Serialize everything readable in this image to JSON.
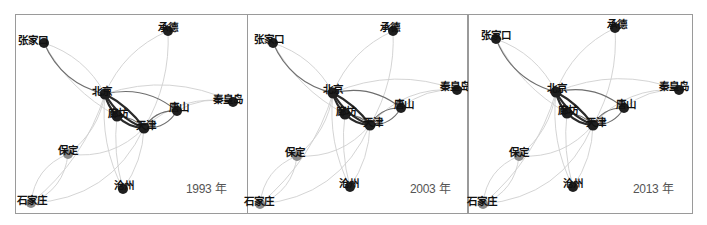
{
  "figure": {
    "type": "network-diagram",
    "colors": {
      "node_dark": "#1f1f1f",
      "node_grey": "#8a8a8a",
      "edge_strong": "#2a2a2a",
      "edge_medium": "#6e6e6e",
      "edge_weak": "#cfcfcf",
      "border": "#9a9a9a"
    }
  },
  "cities": [
    "张家口",
    "承德",
    "北京",
    "秦皇岛",
    "唐山",
    "廊坊",
    "天津",
    "保定",
    "沧州",
    "石家庄"
  ],
  "panels": [
    {
      "year_label": "1993 年",
      "left": 15,
      "width": 233,
      "year_pos": [
        170,
        164
      ],
      "nodes": [
        {
          "name": "张家口",
          "x": 28,
          "y": 28,
          "r": 5,
          "color": "dark",
          "label_dx": -26,
          "label_dy": -2
        },
        {
          "name": "承德",
          "x": 152,
          "y": 16,
          "r": 5,
          "color": "dark",
          "label_dx": -10,
          "label_dy": -3
        },
        {
          "name": "北京",
          "x": 89,
          "y": 79,
          "r": 5.5,
          "color": "dark",
          "label_dx": -13,
          "label_dy": -2
        },
        {
          "name": "秦皇岛",
          "x": 217,
          "y": 87,
          "r": 5,
          "color": "dark",
          "label_dx": -20,
          "label_dy": -2
        },
        {
          "name": "唐山",
          "x": 161,
          "y": 96,
          "r": 5,
          "color": "dark",
          "label_dx": -8,
          "label_dy": -3
        },
        {
          "name": "廊坊",
          "x": 101,
          "y": 101,
          "r": 5.5,
          "color": "dark",
          "label_dx": -9,
          "label_dy": -2
        },
        {
          "name": "天津",
          "x": 128,
          "y": 113,
          "r": 5.5,
          "color": "dark",
          "label_dx": -8,
          "label_dy": -2
        },
        {
          "name": "保定",
          "x": 52,
          "y": 139,
          "r": 5,
          "color": "grey",
          "label_dx": -10,
          "label_dy": -3
        },
        {
          "name": "沧州",
          "x": 107,
          "y": 174,
          "r": 5,
          "color": "dark",
          "label_dx": -9,
          "label_dy": -3
        },
        {
          "name": "石家庄",
          "x": 15,
          "y": 188,
          "r": 5,
          "color": "grey",
          "label_dx": -14,
          "label_dy": -2
        }
      ]
    },
    {
      "year_label": "2003 年",
      "left": 247,
      "width": 221,
      "year_pos": [
        162,
        164
      ],
      "nodes": [
        {
          "name": "张家口",
          "x": 25,
          "y": 28,
          "r": 5,
          "color": "dark",
          "label_dx": -19,
          "label_dy": -3
        },
        {
          "name": "承德",
          "x": 145,
          "y": 16,
          "r": 5,
          "color": "dark",
          "label_dx": -13,
          "label_dy": -3
        },
        {
          "name": "北京",
          "x": 85,
          "y": 78,
          "r": 5.5,
          "color": "dark",
          "label_dx": -10,
          "label_dy": -3
        },
        {
          "name": "秦皇岛",
          "x": 209,
          "y": 75,
          "r": 5,
          "color": "dark",
          "label_dx": -17,
          "label_dy": -3
        },
        {
          "name": "唐山",
          "x": 153,
          "y": 93,
          "r": 5,
          "color": "dark",
          "label_dx": -7,
          "label_dy": -3
        },
        {
          "name": "廊坊",
          "x": 97,
          "y": 99,
          "r": 5.5,
          "color": "dark",
          "label_dx": -9,
          "label_dy": -2
        },
        {
          "name": "天津",
          "x": 122,
          "y": 110,
          "r": 5.5,
          "color": "dark",
          "label_dx": -7,
          "label_dy": -2
        },
        {
          "name": "保定",
          "x": 49,
          "y": 141,
          "r": 5,
          "color": "grey",
          "label_dx": -12,
          "label_dy": -3
        },
        {
          "name": "沧州",
          "x": 102,
          "y": 172,
          "r": 5,
          "color": "dark",
          "label_dx": -11,
          "label_dy": -3
        },
        {
          "name": "石家庄",
          "x": 12,
          "y": 189,
          "r": 5,
          "color": "grey",
          "label_dx": -16,
          "label_dy": -2
        }
      ]
    },
    {
      "year_label": "2013 年",
      "left": 468,
      "width": 225,
      "year_pos": [
        164,
        164
      ],
      "nodes": [
        {
          "name": "张家口",
          "x": 27,
          "y": 24,
          "r": 5,
          "color": "dark",
          "label_dx": -15,
          "label_dy": -3
        },
        {
          "name": "承德",
          "x": 146,
          "y": 13,
          "r": 5,
          "color": "dark",
          "label_dx": -8,
          "label_dy": -3
        },
        {
          "name": "北京",
          "x": 87,
          "y": 77,
          "r": 5.5,
          "color": "dark",
          "label_dx": -9,
          "label_dy": -3
        },
        {
          "name": "秦皇岛",
          "x": 210,
          "y": 75,
          "r": 5,
          "color": "dark",
          "label_dx": -20,
          "label_dy": -3
        },
        {
          "name": "唐山",
          "x": 155,
          "y": 93,
          "r": 5,
          "color": "dark",
          "label_dx": -8,
          "label_dy": -3
        },
        {
          "name": "廊坊",
          "x": 98,
          "y": 98,
          "r": 5.5,
          "color": "dark",
          "label_dx": -9,
          "label_dy": -2
        },
        {
          "name": "天津",
          "x": 124,
          "y": 110,
          "r": 5.5,
          "color": "dark",
          "label_dx": -7,
          "label_dy": -2
        },
        {
          "name": "保定",
          "x": 50,
          "y": 141,
          "r": 5,
          "color": "grey",
          "label_dx": -10,
          "label_dy": -3
        },
        {
          "name": "沧州",
          "x": 104,
          "y": 172,
          "r": 5,
          "color": "dark",
          "label_dx": -10,
          "label_dy": -3
        },
        {
          "name": "石家庄",
          "x": 14,
          "y": 189,
          "r": 5,
          "color": "grey",
          "label_dx": -16,
          "label_dy": -2
        }
      ]
    }
  ],
  "edges": [
    {
      "from": "北京",
      "to": "天津",
      "weight": "strong",
      "bend": 0.18
    },
    {
      "from": "天津",
      "to": "北京",
      "weight": "strong",
      "bend": 0.12
    },
    {
      "from": "北京",
      "to": "廊坊",
      "weight": "strong",
      "bend": 0.15
    },
    {
      "from": "廊坊",
      "to": "天津",
      "weight": "strong",
      "bend": 0.2
    },
    {
      "from": "天津",
      "to": "廊坊",
      "weight": "medium",
      "bend": 0.2
    },
    {
      "from": "北京",
      "to": "唐山",
      "weight": "medium",
      "bend": -0.25
    },
    {
      "from": "天津",
      "to": "唐山",
      "weight": "medium",
      "bend": -0.3
    },
    {
      "from": "唐山",
      "to": "天津",
      "weight": "medium",
      "bend": -0.3
    },
    {
      "from": "张家口",
      "to": "北京",
      "weight": "medium",
      "bend": 0.25
    },
    {
      "from": "北京",
      "to": "秦皇岛",
      "weight": "weak",
      "bend": -0.2
    },
    {
      "from": "天津",
      "to": "秦皇岛",
      "weight": "weak",
      "bend": -0.25
    },
    {
      "from": "唐山",
      "to": "秦皇岛",
      "weight": "weak",
      "bend": -0.2
    },
    {
      "from": "北京",
      "to": "承德",
      "weight": "weak",
      "bend": -0.2
    },
    {
      "from": "天津",
      "to": "承德",
      "weight": "weak",
      "bend": 0.15
    },
    {
      "from": "北京",
      "to": "保定",
      "weight": "weak",
      "bend": -0.2
    },
    {
      "from": "天津",
      "to": "保定",
      "weight": "weak",
      "bend": -0.25
    },
    {
      "from": "北京",
      "to": "石家庄",
      "weight": "weak",
      "bend": -0.15
    },
    {
      "from": "天津",
      "to": "石家庄",
      "weight": "weak",
      "bend": -0.3
    },
    {
      "from": "保定",
      "to": "石家庄",
      "weight": "weak",
      "bend": 0.3
    },
    {
      "from": "石家庄",
      "to": "保定",
      "weight": "weak",
      "bend": 0.3
    },
    {
      "from": "北京",
      "to": "沧州",
      "weight": "weak",
      "bend": 0.15
    },
    {
      "from": "天津",
      "to": "沧州",
      "weight": "weak",
      "bend": -0.15
    },
    {
      "from": "廊坊",
      "to": "沧州",
      "weight": "weak",
      "bend": 0.1
    },
    {
      "from": "张家口",
      "to": "廊坊",
      "weight": "weak",
      "bend": 0.15
    },
    {
      "from": "北京",
      "to": "张家口",
      "weight": "weak",
      "bend": 0.2
    }
  ]
}
